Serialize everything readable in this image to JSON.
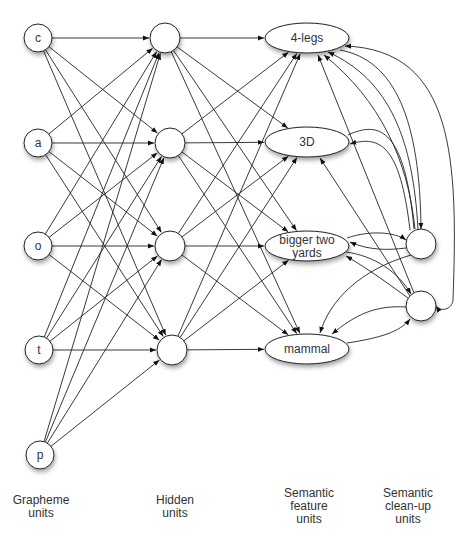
{
  "diagram": {
    "grapheme_units": [
      {
        "id": "c",
        "label": "c",
        "cx": 38,
        "cy": 38
      },
      {
        "id": "a",
        "label": "a",
        "cx": 38,
        "cy": 143
      },
      {
        "id": "o",
        "label": "o",
        "cx": 38,
        "cy": 246
      },
      {
        "id": "t",
        "label": "t",
        "cx": 39,
        "cy": 350
      },
      {
        "id": "p",
        "label": "p",
        "cx": 40,
        "cy": 455
      }
    ],
    "hidden_units": [
      {
        "id": "h1",
        "label": "",
        "cx": 165,
        "cy": 38
      },
      {
        "id": "h2",
        "label": "",
        "cx": 170,
        "cy": 143
      },
      {
        "id": "h3",
        "label": "",
        "cx": 170,
        "cy": 246
      },
      {
        "id": "h4",
        "label": "",
        "cx": 172,
        "cy": 350
      }
    ],
    "semantic_feature_units": [
      {
        "id": "f1",
        "label": "4-legs",
        "cx": 307,
        "cy": 38
      },
      {
        "id": "f2",
        "label": "3D",
        "cx": 307,
        "cy": 142
      },
      {
        "id": "f3",
        "label": "bigger two",
        "label2": "yards",
        "cx": 307,
        "cy": 246
      },
      {
        "id": "f4",
        "label": "mammal",
        "cx": 307,
        "cy": 349
      }
    ],
    "semantic_cleanup_units": [
      {
        "id": "s1",
        "label": "",
        "cx": 421,
        "cy": 244
      },
      {
        "id": "s2",
        "label": "",
        "cx": 421,
        "cy": 306
      }
    ],
    "layer_labels": [
      {
        "id": "grapheme",
        "lines": [
          "Grapheme",
          "units"
        ]
      },
      {
        "id": "hidden",
        "lines": [
          "Hidden",
          "units"
        ]
      },
      {
        "id": "feature",
        "lines": [
          "Semantic",
          "feature",
          "units"
        ]
      },
      {
        "id": "cleanup",
        "lines": [
          "Semantic",
          "clean-up",
          "units"
        ]
      }
    ],
    "colors": {
      "stroke": "#222222",
      "fill": "#ffffff",
      "text": "#333333"
    }
  }
}
